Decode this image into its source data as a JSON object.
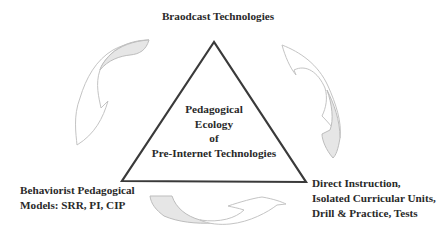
{
  "diagram": {
    "top_node": "Braodcast Technologies",
    "center": {
      "lines": [
        "Pedagogical",
        "Ecology",
        "of",
        "Pre-Internet Technologies"
      ]
    },
    "bottom_left_node": {
      "lines": [
        "Behaviorist Pedagogical",
        "Models: SRR, PI, CIP"
      ]
    },
    "bottom_right_node": {
      "lines": [
        "Direct Instruction,",
        "Isolated Curricular Units,",
        "Drill & Practice, Tests"
      ]
    },
    "arrows": [
      {
        "name": "left-cycle-arrow",
        "direction": "counterclockwise-down"
      },
      {
        "name": "right-cycle-arrow",
        "direction": "clockwise-down"
      },
      {
        "name": "bottom-cycle-arrow",
        "direction": "left-to-right"
      }
    ],
    "colors": {
      "triangle_stroke": "#3a3a3a",
      "arrow_stroke": "#bdbdbd",
      "arrow_fill": "#e6e6e6",
      "text": "#2a2a2a"
    }
  }
}
